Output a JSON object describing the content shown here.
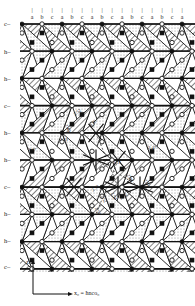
{
  "figure": {
    "kind": "crystal-structure-projection",
    "width": 195,
    "height": 306
  },
  "top_axis": {
    "name": "column-tick-axis",
    "tick_glyph": "|",
    "labels": [
      "a",
      "b",
      "c",
      "a",
      "b",
      "c",
      "a",
      "b",
      "c",
      "a",
      "b",
      "c",
      "a",
      "b",
      "c",
      "a"
    ],
    "x_positions": [
      32,
      42,
      52,
      62,
      72,
      82,
      92,
      102,
      112,
      122,
      132,
      142,
      152,
      162,
      172,
      182
    ],
    "tick_y": 7,
    "label_y": 14
  },
  "left_axis": {
    "name": "stacking-layer-axis",
    "labels": [
      "c–",
      "h–",
      "h–",
      "c–",
      "h–",
      "h–",
      "c–",
      "h–",
      "h–",
      "c–"
    ],
    "y_positions": [
      24,
      52,
      79,
      106,
      133,
      160,
      187,
      214,
      241,
      267
    ],
    "x": 4
  },
  "axes": {
    "vertical_label": "z",
    "horizontal_label": "x₀ = ħnco₀",
    "origin": {
      "x": 33,
      "y": 294
    },
    "v_tip": {
      "x": 33,
      "y": 262
    },
    "h_tip": {
      "x": 70,
      "y": 294
    }
  },
  "bond_labels": [
    {
      "text": "2.52",
      "x": 74,
      "y": 112,
      "rot": -38
    },
    {
      "text": "2.49",
      "x": 66,
      "y": 122,
      "rot": 62
    },
    {
      "text": "2.49",
      "x": 91,
      "y": 124,
      "rot": -55
    },
    {
      "text": "2.31",
      "x": 60,
      "y": 137,
      "rot": 0
    },
    {
      "text": "2.47",
      "x": 28,
      "y": 147,
      "rot": 0
    },
    {
      "text": "2.47",
      "x": 148,
      "y": 145,
      "rot": 0
    },
    {
      "text": "2.31",
      "x": 113,
      "y": 160,
      "rot": 0
    },
    {
      "text": "2.80",
      "x": 128,
      "y": 172,
      "rot": 62
    },
    {
      "text": "2.91",
      "x": 145,
      "y": 177,
      "rot": 62
    },
    {
      "text": "2.52",
      "x": 92,
      "y": 188,
      "rot": -38
    },
    {
      "text": "2.52",
      "x": 102,
      "y": 193,
      "rot": 62
    },
    {
      "text": "2.52",
      "x": 112,
      "y": 190,
      "rot": 62
    },
    {
      "text": "2.52",
      "x": 120,
      "y": 196,
      "rot": -38
    },
    {
      "text": "2.52",
      "x": 96,
      "y": 205,
      "rot": 62
    }
  ],
  "colors": {
    "stroke": "#111111",
    "hatch": "#222222",
    "stipple": "#8a8a8a",
    "background": "#ffffff",
    "atom_filled": "#111111",
    "atom_open": "#ffffff"
  },
  "legend_markers": {
    "filled_square": "cation-site-filled",
    "filled_circle": "anion-site-filled",
    "open_circle": "vacant-site-open"
  }
}
